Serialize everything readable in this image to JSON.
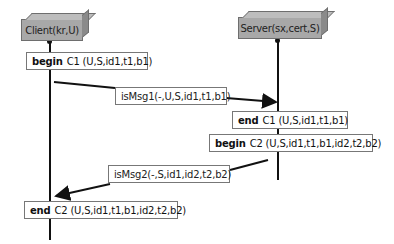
{
  "actors": [
    {
      "id": "client",
      "label": "Client(kr,U)"
    },
    {
      "id": "server",
      "label": "Server(sx,cert,S)"
    }
  ],
  "events": [
    {
      "id": "begin-c1",
      "keyword": "begin",
      "label": "C1 (U,S,id1,t1,b1)",
      "actor": "client"
    },
    {
      "id": "end-c1",
      "keyword": "end",
      "label": "C1 (U,S,id1,t1,b1)",
      "actor": "server"
    },
    {
      "id": "begin-c2",
      "keyword": "begin",
      "label": "C2 (U,S,id1,t1,b1,id2,t2,b2)",
      "actor": "server"
    },
    {
      "id": "end-c2",
      "keyword": "end",
      "label": "C2 (U,S,id1,t1,b1,id2,t2,b2)",
      "actor": "client"
    }
  ],
  "messages": [
    {
      "id": "msg1",
      "label": "isMsg1(-,U,S,id1,t1,b1)",
      "from": "client",
      "to": "server"
    },
    {
      "id": "msg2",
      "label": "isMsg2(-,S,id1,id2,t2,b2)",
      "from": "server",
      "to": "client"
    }
  ],
  "colors": {
    "actor_fill": "#a8a8a8",
    "line": "#111111",
    "box_border": "#777777"
  }
}
